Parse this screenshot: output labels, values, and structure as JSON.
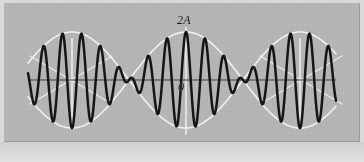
{
  "figure": {
    "kind": "physics-waveform-diagram",
    "labels": {
      "max_amplitude": "2A",
      "origin": "0"
    },
    "colors": {
      "plate_background": "#b4b4b4",
      "page_background": "#d9d9d9",
      "wave_stroke": "#151515",
      "envelope_stroke": "#f2f2f2",
      "axis_stroke": "#3d3d3d",
      "tick_stroke": "#f2f2f2",
      "frame_edge": "#9a9a9a"
    },
    "icon_names": {
      "wave_curve": "waveform-curve-icon",
      "envelope_upper": "envelope-upper-curve-icon",
      "envelope_lower": "envelope-lower-curve-icon",
      "axis_horizontal": "horizontal-axis-icon",
      "node_tick_left": "node-tick-left-icon",
      "node_tick_center": "node-tick-center-icon",
      "node_tick_right": "node-tick-right-icon",
      "node_cross_left": "node-crossing-left-icon",
      "node_cross_right": "node-crossing-right-icon"
    }
  },
  "chart_data": {
    "type": "line",
    "title": "",
    "xlabel": "",
    "ylabel": "",
    "grid": false,
    "legend_position": "none",
    "annotations": [
      {
        "text": "2A",
        "x": 186,
        "y": 20,
        "meaning": "maximum resultant amplitude at beat antinode"
      },
      {
        "text": "0",
        "x": 186,
        "y": 80,
        "meaning": "origin of the displacement axis"
      }
    ],
    "axis": {
      "x_pixel_range": [
        28,
        336
      ],
      "y_pixel_zero": 80,
      "y_amplitude_pixels": 48,
      "ylim_label": [
        "-2A",
        "2A"
      ],
      "xlim_label": [
        "",
        ""
      ]
    },
    "envelope": {
      "description": "slow cosine modulation producing one beat maximum at center and nodes at both sides",
      "node_x_pixels": [
        72,
        300
      ],
      "antinode_x_pixels": [
        186
      ],
      "beat_half_period_pixels": 114,
      "peak_amplitude_pixels": 48
    },
    "carrier": {
      "description": "fast oscillation of the resultant wave",
      "wavelength_pixels": 19,
      "approx_visible_peaks": 16,
      "phase_reference_x_pixels": 186
    },
    "series": [
      {
        "name": "resultant wave (beats)",
        "color": "#151515",
        "formula": "y = 2A * cos(pi*(x-186)/114) * cos(2*pi*(x-186)/19)"
      },
      {
        "name": "upper envelope",
        "color": "#f2f2f2",
        "formula": "y = +2A * |cos(pi*(x-186)/114)|"
      },
      {
        "name": "lower envelope",
        "color": "#f2f2f2",
        "formula": "y = -2A * |cos(pi*(x-186)/114)|"
      }
    ]
  },
  "ticks": {
    "vertical": [
      {
        "name": "node-tick-left",
        "x": 72,
        "y_top": 38,
        "y_bottom": 124
      },
      {
        "name": "antinode-tick-center",
        "x": 186,
        "y_top": 27,
        "y_bottom": 135
      },
      {
        "name": "node-tick-right",
        "x": 300,
        "y_top": 38,
        "y_bottom": 124
      }
    ]
  }
}
